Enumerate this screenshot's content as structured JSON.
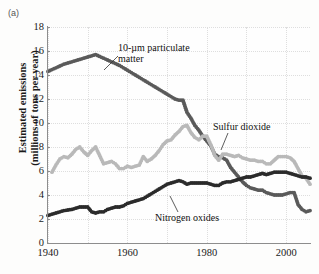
{
  "panel_label": "(a)",
  "chart_data": {
    "type": "scatter",
    "title": "",
    "xlabel": "",
    "ylabel": "Estimated emissions (millions of tons per year)",
    "ylabel_line1": "Estimated emissions",
    "ylabel_line2": "(millions of tons per year)",
    "xlim": [
      1940,
      2006
    ],
    "ylim": [
      0,
      18
    ],
    "ytick_labels": [
      "0",
      "2",
      "4",
      "6",
      "8",
      "10",
      "12",
      "14",
      "16",
      "18"
    ],
    "ytick_values": [
      0,
      2,
      4,
      6,
      8,
      10,
      12,
      14,
      16,
      18
    ],
    "xtick_labels": [
      "1940",
      "1960",
      "1980",
      "2000"
    ],
    "xtick_values": [
      1940,
      1960,
      1980,
      2000
    ],
    "grid": true,
    "legend_position": "inline-annotations",
    "annotations": [
      {
        "text": "10-µm particulate matter",
        "series": "particulate"
      },
      {
        "text": "Sulfur dioxide",
        "series": "sulfur_dioxide"
      },
      {
        "text": "Nitrogen oxides",
        "series": "nitrogen_oxides"
      }
    ],
    "series": [
      {
        "name": "10-µm particulate matter",
        "color": "#5a5a5a",
        "x": [
          1940,
          1942,
          1944,
          1946,
          1948,
          1950,
          1952,
          1954,
          1956,
          1958,
          1960,
          1962,
          1964,
          1966,
          1968,
          1970,
          1971,
          1972,
          1973,
          1974,
          1975,
          1976,
          1977,
          1978,
          1979,
          1980,
          1981,
          1982,
          1983,
          1984,
          1985,
          1986,
          1987,
          1988,
          1989,
          1990,
          1991,
          1992,
          1993,
          1994,
          1995,
          1996,
          1997,
          1998,
          1999,
          2000,
          2001,
          2002,
          2003,
          2004,
          2005,
          2006
        ],
        "y": [
          14.3,
          14.6,
          14.9,
          15.1,
          15.3,
          15.5,
          15.7,
          15.4,
          15.1,
          14.8,
          14.4,
          14.0,
          13.6,
          13.2,
          12.8,
          12.4,
          12.2,
          12.0,
          11.9,
          11.9,
          10.9,
          10.4,
          9.8,
          9.4,
          8.9,
          8.5,
          8.1,
          7.4,
          7.2,
          7.1,
          6.9,
          6.3,
          5.9,
          5.5,
          5.1,
          4.8,
          4.6,
          4.5,
          4.4,
          4.4,
          4.2,
          4.1,
          4.0,
          4.0,
          4.0,
          4.1,
          4.2,
          4.2,
          3.2,
          2.8,
          2.6,
          2.7
        ]
      },
      {
        "name": "Sulfur dioxide",
        "color": "#b9b9b9",
        "x": [
          1941,
          1942,
          1943,
          1944,
          1945,
          1946,
          1947,
          1948,
          1949,
          1950,
          1951,
          1952,
          1953,
          1954,
          1955,
          1956,
          1957,
          1958,
          1959,
          1960,
          1961,
          1962,
          1963,
          1964,
          1965,
          1966,
          1967,
          1968,
          1969,
          1970,
          1971,
          1972,
          1973,
          1974,
          1975,
          1976,
          1977,
          1978,
          1979,
          1980,
          1981,
          1982,
          1983,
          1984,
          1985,
          1986,
          1987,
          1988,
          1989,
          1990,
          1991,
          1992,
          1993,
          1994,
          1995,
          1996,
          1997,
          1998,
          1999,
          2000,
          2001,
          2002,
          2003,
          2004,
          2005,
          2006
        ],
        "y": [
          5.9,
          6.5,
          7.0,
          7.2,
          7.1,
          7.4,
          7.8,
          8.0,
          7.6,
          7.3,
          7.7,
          8.0,
          7.3,
          6.6,
          6.7,
          6.8,
          6.6,
          6.2,
          6.2,
          6.4,
          6.3,
          6.4,
          6.5,
          7.2,
          6.8,
          7.0,
          7.3,
          7.7,
          8.2,
          8.5,
          8.6,
          9.0,
          9.3,
          9.7,
          9.8,
          9.2,
          8.8,
          8.6,
          8.9,
          8.9,
          8.2,
          7.3,
          6.9,
          7.4,
          7.4,
          7.3,
          7.2,
          7.3,
          7.1,
          7.0,
          6.9,
          6.9,
          6.8,
          6.8,
          6.6,
          6.6,
          6.9,
          7.2,
          7.2,
          7.2,
          7.1,
          6.8,
          6.2,
          5.6,
          5.4,
          4.9
        ]
      },
      {
        "name": "Nitrogen oxides",
        "color": "#2b2b2b",
        "x": [
          1940,
          1942,
          1944,
          1946,
          1948,
          1950,
          1951,
          1952,
          1953,
          1954,
          1955,
          1956,
          1957,
          1958,
          1959,
          1960,
          1961,
          1962,
          1963,
          1964,
          1965,
          1966,
          1967,
          1968,
          1969,
          1970,
          1971,
          1972,
          1973,
          1974,
          1975,
          1976,
          1977,
          1978,
          1979,
          1980,
          1981,
          1982,
          1983,
          1984,
          1985,
          1986,
          1987,
          1988,
          1989,
          1990,
          1991,
          1992,
          1993,
          1994,
          1995,
          1996,
          1997,
          1998,
          1999,
          2000,
          2001,
          2002,
          2003,
          2004,
          2005,
          2006
        ],
        "y": [
          2.3,
          2.5,
          2.7,
          2.8,
          3.0,
          3.0,
          2.6,
          2.5,
          2.6,
          2.6,
          2.8,
          2.9,
          3.0,
          3.0,
          3.1,
          3.3,
          3.4,
          3.5,
          3.6,
          3.7,
          3.9,
          4.1,
          4.3,
          4.5,
          4.7,
          4.9,
          5.0,
          5.1,
          5.2,
          5.1,
          4.9,
          5.0,
          5.0,
          5.0,
          5.0,
          5.0,
          4.9,
          4.8,
          4.8,
          5.0,
          5.1,
          5.1,
          5.2,
          5.3,
          5.4,
          5.5,
          5.5,
          5.6,
          5.7,
          5.8,
          5.7,
          5.8,
          5.9,
          5.9,
          5.9,
          5.9,
          5.8,
          5.7,
          5.6,
          5.5,
          5.5,
          5.4
        ]
      }
    ]
  }
}
